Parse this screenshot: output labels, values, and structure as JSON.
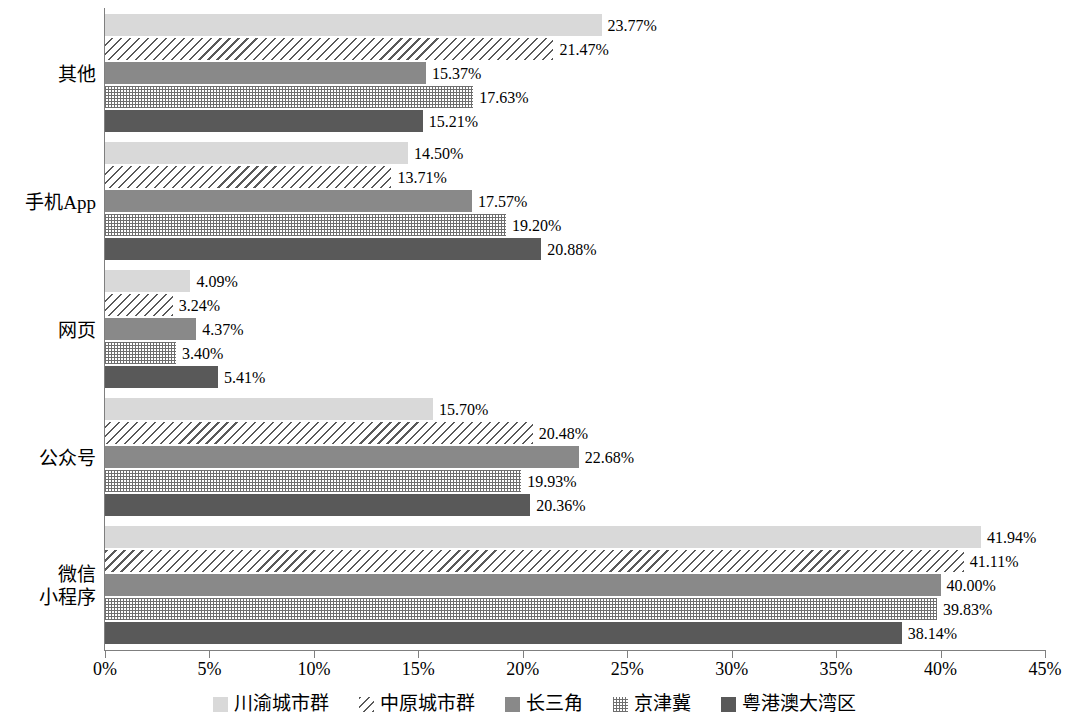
{
  "chart_data": {
    "type": "bar",
    "orientation": "horizontal",
    "title": "",
    "subtitle": "",
    "xlabel": "",
    "ylabel": "",
    "xlim": [
      0,
      45
    ],
    "xtick_step": 5,
    "xticks": [
      "0%",
      "5%",
      "10%",
      "15%",
      "20%",
      "25%",
      "30%",
      "35%",
      "40%",
      "45%"
    ],
    "xtick_values": [
      0,
      5,
      10,
      15,
      20,
      25,
      30,
      35,
      40,
      45
    ],
    "value_suffix": "%",
    "grid": false,
    "legend_position": "bottom",
    "categories": [
      "其他",
      "手机App",
      "网页",
      "公众号",
      "微信\n小程序"
    ],
    "category_order_top_to_bottom": [
      "其他",
      "手机App",
      "网页",
      "公众号",
      "微信小程序"
    ],
    "series": [
      {
        "name": "川渝城市群",
        "pattern": "solid-light-gray",
        "color": "#d9d9d9",
        "values": [
          23.77,
          14.5,
          4.09,
          15.7,
          41.94
        ],
        "labels": [
          "23.77%",
          "14.50%",
          "4.09%",
          "15.70%",
          "41.94%"
        ]
      },
      {
        "name": "中原城市群",
        "pattern": "diagonal-hatch",
        "color": "#595959",
        "values": [
          21.47,
          13.71,
          3.24,
          20.48,
          41.11
        ],
        "labels": [
          "21.47%",
          "13.71%",
          "3.24%",
          "20.48%",
          "41.11%"
        ]
      },
      {
        "name": "长三角",
        "pattern": "solid-medium-gray",
        "color": "#898989",
        "values": [
          15.37,
          17.57,
          4.37,
          22.68,
          40.0
        ],
        "labels": [
          "15.37%",
          "17.57%",
          "4.37%",
          "22.68%",
          "40.00%"
        ]
      },
      {
        "name": "京津冀",
        "pattern": "dot-grid",
        "color": "#6e6e6e",
        "values": [
          17.63,
          19.2,
          3.4,
          19.93,
          39.83
        ],
        "labels": [
          "17.63%",
          "19.20%",
          "3.40%",
          "19.93%",
          "39.83%"
        ]
      },
      {
        "name": "粤港澳大湾区",
        "pattern": "solid-dark-gray",
        "color": "#595959",
        "values": [
          15.21,
          20.88,
          5.41,
          20.36,
          38.14
        ],
        "labels": [
          "15.21%",
          "20.88%",
          "5.41%",
          "20.36%",
          "38.14%"
        ]
      }
    ]
  },
  "legend": {
    "items": [
      {
        "label": "川渝城市群",
        "swatch": "solid-light-gray"
      },
      {
        "label": "中原城市群",
        "swatch": "diagonal-hatch"
      },
      {
        "label": "长三角",
        "swatch": "solid-medium-gray"
      },
      {
        "label": "京津冀",
        "swatch": "dot-grid"
      },
      {
        "label": "粤港澳大湾区",
        "swatch": "solid-dark-gray"
      }
    ]
  }
}
